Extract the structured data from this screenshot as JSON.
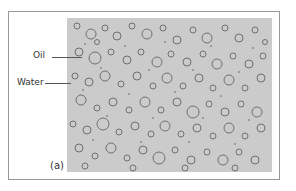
{
  "figure": {
    "labels": {
      "oil": "Oil",
      "water": "Water",
      "panel": "(a)"
    },
    "photo": {
      "description": "micrograph of oil droplets dispersed in water",
      "background_color": "#c9c9c9",
      "droplet_color": "#6e6e6e"
    }
  }
}
